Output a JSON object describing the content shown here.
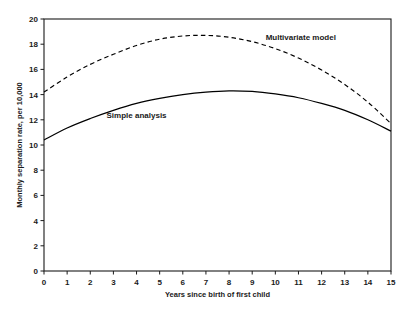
{
  "chart_data": {
    "type": "line",
    "title": "",
    "xlabel": "Years since birth of first child",
    "ylabel": "Monthly separation rate, per 10,000",
    "xlim": [
      0,
      15
    ],
    "ylim": [
      0,
      20
    ],
    "xticks": [
      "0",
      "1",
      "2",
      "3",
      "4",
      "5",
      "6",
      "7",
      "8",
      "9",
      "10",
      "11",
      "12",
      "13",
      "14",
      "15"
    ],
    "yticks": [
      "0",
      "2",
      "4",
      "6",
      "8",
      "10",
      "12",
      "14",
      "16",
      "18",
      "20"
    ],
    "grid": false,
    "legend_position": "inline-annotation",
    "x": [
      0,
      1,
      2,
      3,
      4,
      5,
      6,
      7,
      8,
      9,
      10,
      11,
      12,
      13,
      14,
      15
    ],
    "series": [
      {
        "name": "Multivariate model",
        "style": "dashed",
        "color": "#000000",
        "values": [
          14.2,
          15.4,
          16.4,
          17.2,
          17.9,
          18.4,
          18.65,
          18.7,
          18.55,
          18.2,
          17.65,
          16.9,
          15.95,
          14.8,
          13.4,
          11.7
        ]
      },
      {
        "name": "Simple analysis",
        "style": "solid",
        "color": "#000000",
        "values": [
          10.4,
          11.35,
          12.1,
          12.75,
          13.3,
          13.7,
          14.0,
          14.2,
          14.3,
          14.25,
          14.05,
          13.75,
          13.3,
          12.75,
          12.0,
          11.1
        ]
      }
    ],
    "annotations": [
      {
        "text": "Multivariate model",
        "x": 11.1,
        "y": 18.35
      },
      {
        "text": "Simple analysis",
        "x": 4.0,
        "y": 12.15
      }
    ]
  }
}
